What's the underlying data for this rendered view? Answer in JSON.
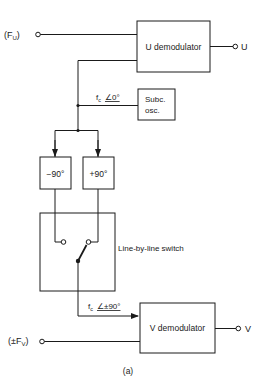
{
  "diagram": {
    "caption": "(a)",
    "inputs": {
      "fu": {
        "open": "(F",
        "sub": "U",
        "close": ")"
      },
      "fv": {
        "open": "(±F",
        "sub": "V",
        "close": ")"
      }
    },
    "blocks": {
      "u_demod": "U demodulator",
      "v_demod": "V demodulator",
      "subc_osc_line1": "Subc.",
      "subc_osc_line2": "osc.",
      "minus90": "−90°",
      "plus90": "+90°",
      "switch_label": "Line-by-line switch"
    },
    "outputs": {
      "u": "U",
      "v": "V"
    },
    "signals": {
      "subcarrier_0": {
        "f": "f",
        "sub": "c",
        "angle": "∠0°"
      },
      "subcarrier_pm90": {
        "f": "f",
        "sub": "c",
        "angle": "∠±90°"
      }
    },
    "colors": {
      "ink": "#1a1a1a",
      "background": "#ffffff"
    }
  }
}
